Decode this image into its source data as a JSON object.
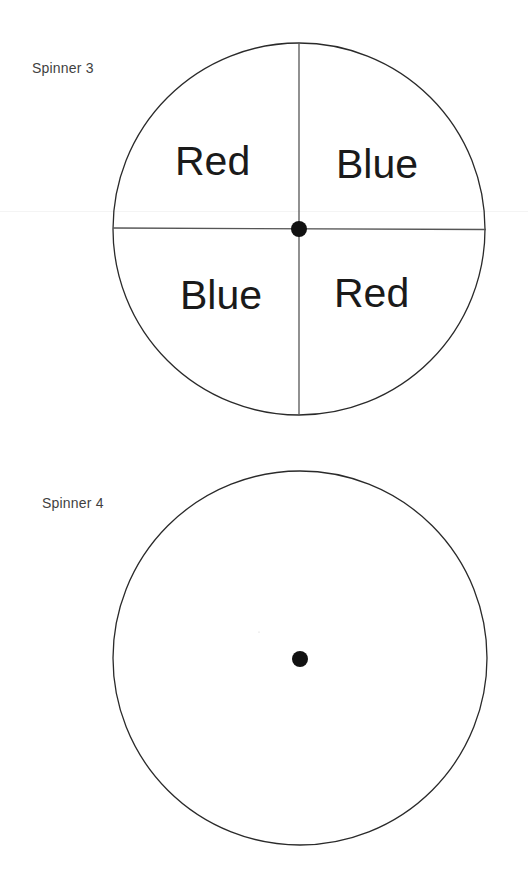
{
  "colors": {
    "background": "#ffffff",
    "outline": "#2a2a2a",
    "divider": "#555555",
    "center_dot": "#111111",
    "label_text": "#3f3f3f",
    "sector_text": "#1a1a1a"
  },
  "spinners": [
    {
      "title": "Spinner 3",
      "center": [
        299,
        229
      ],
      "radius": 186,
      "divided": true,
      "sectors": [
        {
          "position": "top-left",
          "label": "Red"
        },
        {
          "position": "top-right",
          "label": "Blue"
        },
        {
          "position": "bottom-left",
          "label": "Blue"
        },
        {
          "position": "bottom-right",
          "label": "Red"
        }
      ]
    },
    {
      "title": "Spinner 4",
      "center": [
        300,
        658
      ],
      "radius": 187,
      "divided": false,
      "sectors": []
    }
  ]
}
